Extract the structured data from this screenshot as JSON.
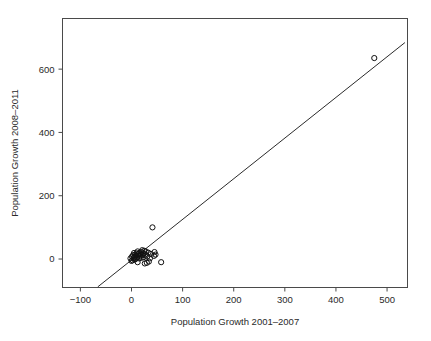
{
  "chart_data": {
    "type": "scatter",
    "title": "",
    "xlabel": "Population Growth 2001–2007",
    "ylabel": "Population Growth 2008–2011",
    "xlim": [
      -135,
      540
    ],
    "ylim": [
      -90,
      760
    ],
    "xticks": [
      -100,
      0,
      100,
      200,
      300,
      400,
      500
    ],
    "xticklabels": [
      "−100",
      "0",
      "100",
      "200",
      "300",
      "400",
      "500"
    ],
    "yticks": [
      0,
      200,
      400,
      600
    ],
    "yticklabels": [
      "0",
      "200",
      "400",
      "600"
    ],
    "grid": false,
    "legend": null,
    "marker": "open-circle",
    "marker_color": "#111111",
    "line_color": "#2b2b2b",
    "reference_line": {
      "description": "fitted straight line through the point cloud",
      "x_start": -66,
      "y_start": -88,
      "x_end": 535,
      "y_end": 684,
      "slope": 1.28,
      "intercept": -3.5
    },
    "points": [
      {
        "x": 475,
        "y": 635
      },
      {
        "x": 41,
        "y": 100
      },
      {
        "x": 58,
        "y": -10
      },
      {
        "x": 45,
        "y": 22
      },
      {
        "x": 44,
        "y": 10
      },
      {
        "x": 38,
        "y": 16
      },
      {
        "x": 36,
        "y": 2
      },
      {
        "x": 33,
        "y": 20
      },
      {
        "x": 31,
        "y": 8
      },
      {
        "x": 30,
        "y": -12
      },
      {
        "x": 28,
        "y": 24
      },
      {
        "x": 27,
        "y": 14
      },
      {
        "x": 25,
        "y": 26
      },
      {
        "x": 24,
        "y": 6
      },
      {
        "x": 23,
        "y": 18
      },
      {
        "x": 22,
        "y": 12
      },
      {
        "x": 21,
        "y": 28
      },
      {
        "x": 20,
        "y": 4
      },
      {
        "x": 19,
        "y": 22
      },
      {
        "x": 18,
        "y": 14
      },
      {
        "x": 17,
        "y": 9
      },
      {
        "x": 16,
        "y": 20
      },
      {
        "x": 15,
        "y": 2
      },
      {
        "x": 14,
        "y": 16
      },
      {
        "x": 13,
        "y": 11
      },
      {
        "x": 12,
        "y": 24
      },
      {
        "x": 11,
        "y": 5
      },
      {
        "x": 10,
        "y": 18
      },
      {
        "x": 9,
        "y": 10
      },
      {
        "x": 8,
        "y": 0
      },
      {
        "x": 7,
        "y": 14
      },
      {
        "x": 6,
        "y": 7
      },
      {
        "x": 5,
        "y": 19
      },
      {
        "x": 4,
        "y": 3
      },
      {
        "x": 3,
        "y": 12
      },
      {
        "x": 2,
        "y": -4
      },
      {
        "x": 1,
        "y": 8
      },
      {
        "x": 0,
        "y": -6
      },
      {
        "x": -2,
        "y": 2
      },
      {
        "x": 26,
        "y": -14
      },
      {
        "x": 34,
        "y": -8
      },
      {
        "x": 12,
        "y": -10
      },
      {
        "x": 6,
        "y": -2
      },
      {
        "x": 47,
        "y": 14
      }
    ]
  },
  "axes": {
    "x_title": "Population Growth 2001–2007",
    "y_title": "Population Growth 2008–2011"
  }
}
